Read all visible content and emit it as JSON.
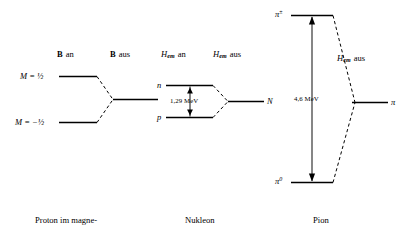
{
  "figure": {
    "panels": [
      {
        "id": "proton",
        "caption_line1": "Proton im magne-",
        "caption_line2": "tischen Feld",
        "header_left_bold": "B",
        "header_left_rest": "an",
        "header_right_bold": "B",
        "header_right_rest": "aus",
        "level_upper_label": "M = ½",
        "level_lower_label": "M = −½"
      },
      {
        "id": "nukleon",
        "caption_line1": "Nukleon",
        "caption_line2": "",
        "header_left_main": "H",
        "header_left_sub": "em",
        "header_left_rest": "an",
        "header_right_main": "H",
        "header_right_sub": "em",
        "header_right_rest": "aus",
        "level_upper_label": "n",
        "level_lower_label": "p",
        "merged_label": "N",
        "gap_energy": "1,29 MeV"
      },
      {
        "id": "pion",
        "caption_line1": "Pion",
        "caption_line2": "",
        "header_main": "H",
        "header_sub": "em",
        "header_rest": "aus",
        "level_upper_main": "π",
        "level_upper_sup": "±",
        "level_lower_main": "π",
        "level_lower_sup": "0",
        "merged_label": "π",
        "gap_energy": "4,6 MeV"
      }
    ],
    "colors": {
      "ink": "#000000",
      "background": "#ffffff"
    }
  }
}
